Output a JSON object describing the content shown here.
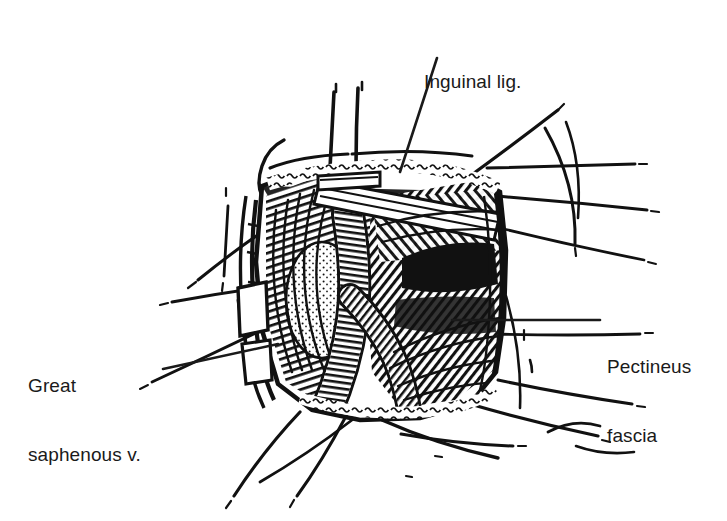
{
  "figure": {
    "type": "line-art-anatomical-illustration",
    "style": "black-and-white pen-and-ink hatched medical illustration",
    "background_color": "#ffffff",
    "ink_color": "#111111",
    "text_color": "#1a1a1a"
  },
  "labels": [
    {
      "id": "inguinal",
      "text": "Inguinal lig.",
      "lines": [
        "Inguinal lig."
      ],
      "position": "top-center",
      "leader": "diagonal line descending left into the upper wound"
    },
    {
      "id": "saphenous",
      "text": "Great saphenous v.",
      "lines": [
        "Great",
        "saphenous v."
      ],
      "position": "left",
      "leader": "line rising to the right toward the left wound margin"
    },
    {
      "id": "pectineus",
      "text": "Pectineus fascia",
      "lines": [
        "Pectineus",
        "fascia"
      ],
      "position": "right",
      "leader": "horizontal line running left into the hatched fascia"
    }
  ],
  "label_inguinal_line_1": "Inguinal lig.",
  "label_saphenous_line_1": "Great",
  "label_saphenous_line_2": "saphenous v.",
  "label_pectineus_line_1": "Pectineus",
  "label_pectineus_line_2": "fascia"
}
